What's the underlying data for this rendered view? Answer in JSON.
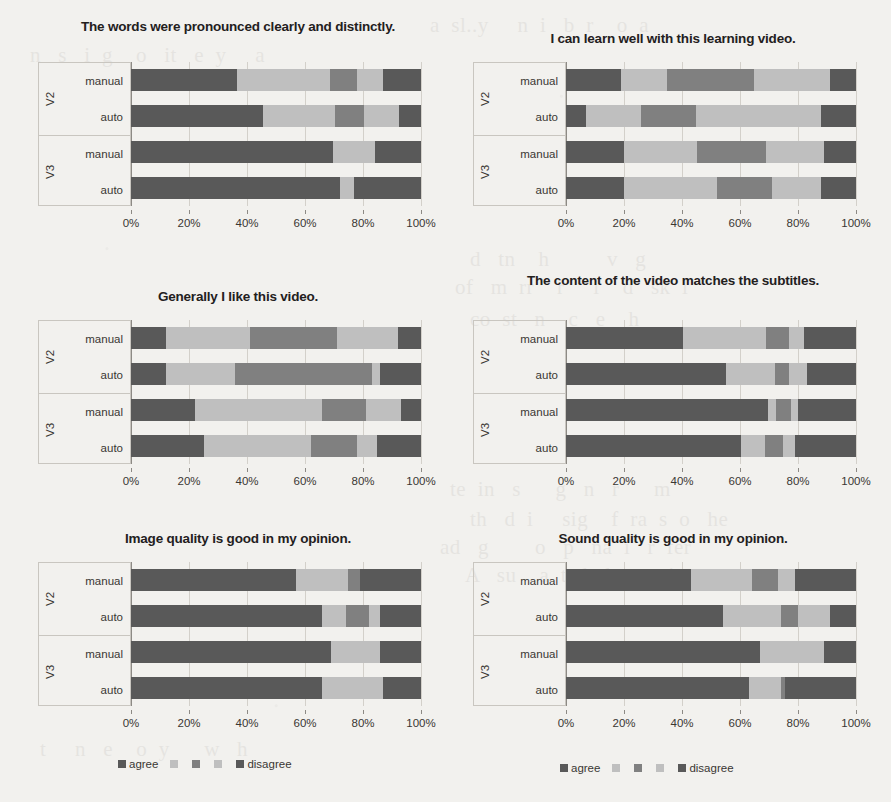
{
  "page": {
    "background_color": "#f2f1ee",
    "bleed_through_text": [
      "a text line behind",
      "faint reversed text",
      "scanned page bleed"
    ]
  },
  "palette": {
    "agree": "#595959",
    "light2": "#bfbfbf",
    "mid3": "#808080",
    "light4": "#bfbfbf",
    "disagree": "#595959",
    "grid": "#d3d0ca",
    "axis": "#8d8a85",
    "box_border": "#c9c6c0",
    "text": "#3a3733"
  },
  "legend": {
    "first_label": "agree",
    "last_label": "disagree",
    "swatch_colors": [
      "#595959",
      "#bfbfbf",
      "#808080",
      "#bfbfbf",
      "#595959"
    ]
  },
  "axis": {
    "ticks": [
      "0%",
      "20%",
      "40%",
      "60%",
      "80%",
      "100%"
    ],
    "tick_values": [
      0,
      20,
      40,
      60,
      80,
      100
    ],
    "min": 0,
    "max": 100
  },
  "groups": [
    {
      "name": "V2",
      "rows": [
        "manual",
        "auto"
      ]
    },
    {
      "name": "V3",
      "rows": [
        "manual",
        "auto"
      ]
    }
  ],
  "chart_data": [
    {
      "id": "words-pronounced",
      "type": "bar",
      "orientation": "horizontal",
      "stacked": true,
      "normalized_percent": true,
      "title": "The words were pronounced clearly and distinctly.",
      "xlabel": "",
      "ylabel": "",
      "xlim": [
        0,
        100
      ],
      "grid": true,
      "legend_position": "bottom",
      "group_labels": [
        "V2",
        "V3"
      ],
      "categories": [
        "V2 manual",
        "V2 auto",
        "V3 manual",
        "V3 auto"
      ],
      "series": [
        {
          "name": "agree",
          "values": [
            36.5,
            45.5,
            69.5,
            72.0
          ]
        },
        {
          "name": "2",
          "values": [
            32.0,
            25.0,
            14.5,
            5.0
          ]
        },
        {
          "name": "3",
          "values": [
            9.5,
            10.0,
            0.0,
            0.0
          ]
        },
        {
          "name": "4",
          "values": [
            9.0,
            12.0,
            0.0,
            0.0
          ]
        },
        {
          "name": "disagree",
          "values": [
            13.0,
            7.5,
            16.0,
            23.0
          ]
        }
      ]
    },
    {
      "id": "learn-well",
      "type": "bar",
      "orientation": "horizontal",
      "stacked": true,
      "normalized_percent": true,
      "title": "I can learn well with this learning video.",
      "xlabel": "",
      "ylabel": "",
      "xlim": [
        0,
        100
      ],
      "grid": true,
      "legend_position": "bottom",
      "group_labels": [
        "V2",
        "V3"
      ],
      "categories": [
        "V2 manual",
        "V2 auto",
        "V3 manual",
        "V3 auto"
      ],
      "series": [
        {
          "name": "agree",
          "values": [
            19.0,
            7.0,
            20.0,
            20.0
          ]
        },
        {
          "name": "2",
          "values": [
            16.0,
            19.0,
            25.0,
            32.0
          ]
        },
        {
          "name": "3",
          "values": [
            30.0,
            19.0,
            24.0,
            19.0
          ]
        },
        {
          "name": "4",
          "values": [
            26.0,
            43.0,
            20.0,
            17.0
          ]
        },
        {
          "name": "disagree",
          "values": [
            9.0,
            12.0,
            11.0,
            12.0
          ]
        }
      ]
    },
    {
      "id": "generally-like",
      "type": "bar",
      "orientation": "horizontal",
      "stacked": true,
      "normalized_percent": true,
      "title": "Generally I like this video.",
      "xlabel": "",
      "ylabel": "",
      "xlim": [
        0,
        100
      ],
      "grid": true,
      "legend_position": "bottom",
      "group_labels": [
        "V2",
        "V3"
      ],
      "categories": [
        "V2 manual",
        "V2 auto",
        "V3 manual",
        "V3 auto"
      ],
      "series": [
        {
          "name": "agree",
          "values": [
            12.0,
            12.0,
            22.0,
            25.0
          ]
        },
        {
          "name": "2",
          "values": [
            29.0,
            24.0,
            44.0,
            37.0
          ]
        },
        {
          "name": "3",
          "values": [
            30.0,
            47.0,
            15.0,
            16.0
          ]
        },
        {
          "name": "4",
          "values": [
            21.0,
            3.0,
            12.0,
            7.0
          ]
        },
        {
          "name": "disagree",
          "values": [
            8.0,
            14.0,
            7.0,
            15.0
          ]
        }
      ]
    },
    {
      "id": "content-matches-subtitles",
      "type": "bar",
      "orientation": "horizontal",
      "stacked": true,
      "normalized_percent": true,
      "title": "The content of the video matches the subtitles.",
      "xlabel": "",
      "ylabel": "",
      "xlim": [
        0,
        100
      ],
      "grid": true,
      "legend_position": "bottom",
      "group_labels": [
        "V2",
        "V3"
      ],
      "categories": [
        "V2 manual",
        "V2 auto",
        "V3 manual",
        "V3 auto"
      ],
      "series": [
        {
          "name": "agree",
          "values": [
            40.5,
            55.0,
            69.5,
            60.5
          ]
        },
        {
          "name": "2",
          "values": [
            28.5,
            17.0,
            3.0,
            8.0
          ]
        },
        {
          "name": "3",
          "values": [
            8.0,
            5.0,
            5.0,
            6.5
          ]
        },
        {
          "name": "4",
          "values": [
            5.0,
            6.0,
            2.5,
            4.0
          ]
        },
        {
          "name": "disagree",
          "values": [
            18.0,
            17.0,
            20.0,
            21.0
          ]
        }
      ]
    },
    {
      "id": "image-quality",
      "type": "bar",
      "orientation": "horizontal",
      "stacked": true,
      "normalized_percent": true,
      "title": "Image quality is good in my opinion.",
      "xlabel": "",
      "ylabel": "",
      "xlim": [
        0,
        100
      ],
      "grid": true,
      "legend_position": "bottom",
      "group_labels": [
        "V2",
        "V3"
      ],
      "categories": [
        "V2 manual",
        "V2 auto",
        "V3 manual",
        "V3 auto"
      ],
      "series": [
        {
          "name": "agree",
          "values": [
            57.0,
            66.0,
            69.0,
            66.0
          ]
        },
        {
          "name": "2",
          "values": [
            18.0,
            8.0,
            17.0,
            21.0
          ]
        },
        {
          "name": "3",
          "values": [
            4.0,
            8.0,
            0.0,
            0.0
          ]
        },
        {
          "name": "4",
          "values": [
            0.0,
            4.0,
            0.0,
            0.0
          ]
        },
        {
          "name": "disagree",
          "values": [
            21.0,
            14.0,
            14.0,
            13.0
          ]
        }
      ]
    },
    {
      "id": "sound-quality",
      "type": "bar",
      "orientation": "horizontal",
      "stacked": true,
      "normalized_percent": true,
      "title": "Sound quality is good in my opinion.",
      "xlabel": "",
      "ylabel": "",
      "xlim": [
        0,
        100
      ],
      "grid": true,
      "legend_position": "bottom",
      "group_labels": [
        "V2",
        "V3"
      ],
      "categories": [
        "V2 manual",
        "V2 auto",
        "V3 manual",
        "V3 auto"
      ],
      "series": [
        {
          "name": "agree",
          "values": [
            43.0,
            54.0,
            67.0,
            63.0
          ]
        },
        {
          "name": "2",
          "values": [
            21.0,
            20.0,
            22.0,
            11.0
          ]
        },
        {
          "name": "3",
          "values": [
            9.0,
            6.0,
            0.0,
            1.5
          ]
        },
        {
          "name": "4",
          "values": [
            6.0,
            11.0,
            0.0,
            0.0
          ]
        },
        {
          "name": "disagree",
          "values": [
            21.0,
            9.0,
            11.0,
            24.5
          ]
        }
      ]
    }
  ]
}
